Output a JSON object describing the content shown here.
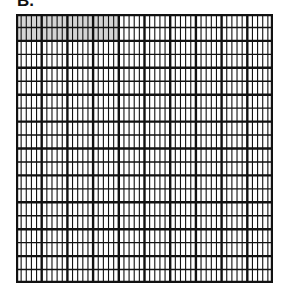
{
  "figure": {
    "label": "B.",
    "grid": {
      "rows": 20,
      "columns": 50,
      "total_cells": 1000,
      "major_row_every": 2,
      "major_col_every": 5,
      "shaded": {
        "row_start": 0,
        "row_end": 2,
        "col_start": 0,
        "col_end": 20,
        "cells": 40
      },
      "colors": {
        "line": "#111111",
        "shade": "#d4d4d4",
        "background": "#ffffff"
      }
    }
  }
}
